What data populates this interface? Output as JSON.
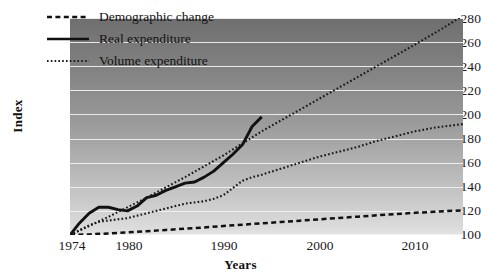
{
  "chart_data": {
    "type": "line",
    "title": "",
    "xlabel": "Years",
    "ylabel": "Index",
    "xlim": [
      1974,
      2015
    ],
    "ylim": [
      100,
      280
    ],
    "yticks": [
      100,
      120,
      140,
      160,
      180,
      200,
      220,
      240,
      260,
      280
    ],
    "xticks": [
      1974,
      1980,
      1990,
      2000,
      2010
    ],
    "grid": true,
    "legend_position": "top-left",
    "background": "gradient grey, dark at top to light at bottom",
    "series": [
      {
        "name": "Demographic change",
        "style": "dashed",
        "color": "#111111",
        "x": [
          1974,
          1976,
          1978,
          1980,
          1982,
          1984,
          1986,
          1988,
          1990,
          1992,
          1994,
          1996,
          1998,
          2000,
          2002,
          2004,
          2006,
          2008,
          2010,
          2012,
          2015
        ],
        "y": [
          100,
          100.5,
          101.3,
          102.2,
          103.2,
          104.2,
          105.2,
          106.3,
          107.5,
          108.6,
          109.7,
          110.8,
          111.9,
          113.0,
          114.1,
          115.2,
          116.3,
          117.4,
          118.4,
          119.3,
          120.5
        ]
      },
      {
        "name": "Real expenditure",
        "style": "solid",
        "color": "#111111",
        "x": [
          1974,
          1975,
          1976,
          1977,
          1978,
          1979,
          1980,
          1981,
          1982,
          1983,
          1984,
          1985,
          1986,
          1987,
          1988,
          1989,
          1990,
          1991,
          1992,
          1993,
          1994
        ],
        "y": [
          100,
          110,
          118,
          123,
          123,
          121,
          120,
          124,
          131,
          133,
          137,
          140,
          143,
          144,
          148,
          153,
          160,
          167,
          175,
          190,
          198
        ]
      },
      {
        "name": "Volume expenditure",
        "style": "dotted",
        "color": "#1a1a1a",
        "x": [
          1974,
          1975,
          1976,
          1977,
          1978,
          1979,
          1980,
          1981,
          1982,
          1983,
          1984,
          1985,
          1986,
          1987,
          1988,
          1989,
          1990,
          1991,
          1992,
          1993,
          1994,
          1996,
          1998,
          2000,
          2002,
          2004,
          2006,
          2008,
          2010,
          2012,
          2015
        ],
        "y": [
          100,
          104,
          108,
          111,
          112,
          113,
          114,
          116,
          118,
          120,
          122,
          124,
          126,
          127,
          128,
          130,
          133,
          139,
          145,
          148,
          150,
          155,
          160,
          165,
          169,
          173,
          178,
          182,
          186,
          189,
          192
        ]
      },
      {
        "name": "Volume expenditure projection upper",
        "style": "dotted",
        "color": "#1a1a1a",
        "x": [
          1974,
          1978,
          1982,
          1986,
          1990,
          1994,
          1998,
          2002,
          2006,
          2010,
          2013,
          2015
        ],
        "y": [
          100,
          115,
          131,
          148,
          166,
          186,
          204,
          222,
          240,
          258,
          272,
          282
        ]
      }
    ]
  },
  "legend": {
    "items": [
      {
        "label": "Demographic change",
        "style": "dashed"
      },
      {
        "label": "Real expenditure",
        "style": "solid"
      },
      {
        "label": "Volume expenditure",
        "style": "dotted"
      }
    ]
  },
  "axes": {
    "y_title": "Index",
    "x_title": "Years",
    "y_labels": [
      "280",
      "260",
      "240",
      "220",
      "200",
      "180",
      "160",
      "140",
      "120",
      "100"
    ],
    "x_labels": [
      "1974",
      "1980",
      "1990",
      "2000",
      "2010"
    ]
  }
}
